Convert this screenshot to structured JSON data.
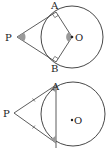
{
  "diagrams": [
    {
      "labels": {
        "P": "P",
        "A": "A",
        "B": "B",
        "O": "O"
      },
      "description": "Tangents PA and PB from external point P to circle with center O; right angles at A and B; angles at P and O shaded"
    },
    {
      "labels": {
        "P": "P",
        "A": "A",
        "O": "O"
      },
      "description": "Tangents PA and PB equal (tick marks); chord AB drawn; angles PAB and PBA shaded"
    }
  ],
  "colors": {
    "stroke": "#333333",
    "shade": "#9a9a9a"
  }
}
